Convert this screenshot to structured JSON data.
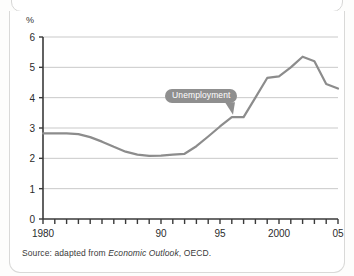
{
  "figure": {
    "unit_label": "%",
    "source_note_prefix": "Source: adapted from ",
    "source_note_italic": "Economic Outlook",
    "source_note_suffix": ", OECD.",
    "callout_label": "Unemployment",
    "callout_color": "#8f8f8f",
    "line_color": "#8c8c8c",
    "axis_color": "#3a3a3a",
    "grid_color": "#c9c9c9"
  },
  "chart_data": {
    "type": "line",
    "title": "",
    "xlabel": "",
    "ylabel": "%",
    "xlim": [
      1980,
      2005
    ],
    "ylim": [
      0,
      6
    ],
    "grid": true,
    "legend": "none",
    "y_ticks": [
      0,
      1,
      2,
      3,
      4,
      5,
      6
    ],
    "y_tick_labels": [
      "0",
      "1",
      "2",
      "3",
      "4",
      "5",
      "6"
    ],
    "x_ticks": [
      1980,
      1981,
      1982,
      1983,
      1984,
      1985,
      1986,
      1987,
      1988,
      1989,
      1990,
      1991,
      1992,
      1993,
      1994,
      1995,
      1996,
      1997,
      1998,
      1999,
      2000,
      2001,
      2002,
      2003,
      2004,
      2005
    ],
    "x_tick_labels": [
      {
        "x": 1980,
        "label": "1980"
      },
      {
        "x": 1990,
        "label": "90"
      },
      {
        "x": 1995,
        "label": "95"
      },
      {
        "x": 2000,
        "label": "2000"
      },
      {
        "x": 2005,
        "label": "05"
      }
    ],
    "annotations": [
      {
        "text": "Unemployment",
        "x": 1995.6,
        "y": 4.05,
        "points_to_x": 1996.1,
        "points_to_y": 3.4
      }
    ],
    "series": [
      {
        "name": "Unemployment",
        "color": "#8c8c8c",
        "x": [
          1980,
          1981,
          1982,
          1983,
          1984,
          1985,
          1986,
          1987,
          1988,
          1989,
          1990,
          1991,
          1992,
          1993,
          1994,
          1995,
          1996,
          1997,
          1998,
          1999,
          2000,
          2001,
          2002,
          2003,
          2004,
          2005
        ],
        "values": [
          2.82,
          2.82,
          2.82,
          2.8,
          2.7,
          2.55,
          2.38,
          2.22,
          2.12,
          2.08,
          2.09,
          2.12,
          2.15,
          2.4,
          2.72,
          3.05,
          3.36,
          3.36,
          4.0,
          4.65,
          4.7,
          5.0,
          5.35,
          5.2,
          4.45,
          4.3
        ]
      }
    ]
  }
}
